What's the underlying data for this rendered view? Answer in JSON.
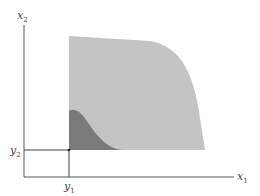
{
  "diagram": {
    "axes": {
      "x_label": "x",
      "x_label_sub": "1",
      "y_label": "x",
      "y_label_sub": "2"
    },
    "point": {
      "x_label": "y",
      "x_label_sub": "1",
      "y_label": "y",
      "y_label_sub": "2"
    },
    "regions": [
      {
        "name": "light-region",
        "color": "#c4c4c4"
      },
      {
        "name": "dark-region",
        "color": "#7a7a7a"
      }
    ],
    "colors": {
      "axis": "#555555",
      "guide": "#444444"
    }
  }
}
